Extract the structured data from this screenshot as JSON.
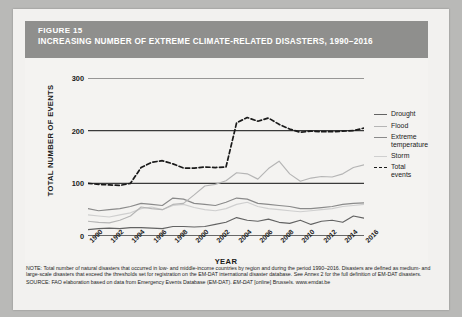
{
  "header": {
    "figure_label": "FIGURE 15",
    "title": "INCREASING NUMBER OF EXTREME CLIMATE-RELATED DISASTERS, 1990–2016"
  },
  "axes": {
    "ylabel": "TOTAL NUMBER OF EVENTS",
    "xlabel": "YEAR"
  },
  "legend": {
    "items": [
      {
        "label": "Drought",
        "color": "#636363",
        "style": "solid"
      },
      {
        "label": "Flood",
        "color": "#b5b5b5",
        "style": "solid"
      },
      {
        "label": "Extreme temperature",
        "color": "#8a8a8a",
        "style": "solid"
      },
      {
        "label": "Storm",
        "color": "#cfcfcf",
        "style": "solid"
      },
      {
        "label": "Total events",
        "color": "#1a1a1a",
        "style": "dashed"
      }
    ]
  },
  "notes": {
    "note": "NOTE: Total number of natural disasters that occurred in low- and middle-income countries by region and during the period 1990–2016. Disasters are defined as medium- and large-scale disasters that exceed the thresholds set for registration on the EM-DAT international disaster database. See Annex 2 for the full definition of EM-DAT disasters.",
    "source_prefix": "SOURCE: FAO elaboration based on data from Emergency Events Database (EM-DAT). ",
    "source_italic": "EM-DAT ",
    "source_suffix": "[online] Brussels. www.emdat.be"
  },
  "chart_data": {
    "type": "line",
    "title": "INCREASING NUMBER OF EXTREME CLIMATE-RELATED DISASTERS, 1990–2016",
    "xlabel": "YEAR",
    "ylabel": "TOTAL NUMBER OF EVENTS",
    "grid": true,
    "legend_position": "right",
    "xlim": [
      1990,
      2016
    ],
    "ylim": [
      0,
      300
    ],
    "yticks": [
      0,
      100,
      200,
      300
    ],
    "xticks": [
      1990,
      1992,
      1994,
      1996,
      1998,
      2000,
      2002,
      2004,
      2006,
      2008,
      2010,
      2012,
      2014,
      2016
    ],
    "x": [
      1990,
      1991,
      1992,
      1993,
      1994,
      1995,
      1996,
      1997,
      1998,
      1999,
      2000,
      2001,
      2002,
      2003,
      2004,
      2005,
      2006,
      2007,
      2008,
      2009,
      2010,
      2011,
      2012,
      2013,
      2014,
      2015,
      2016
    ],
    "series": [
      {
        "name": "Total events",
        "color": "#1a1a1a",
        "style": "dashed",
        "values": [
          100,
          98,
          97,
          96,
          100,
          130,
          140,
          143,
          137,
          129,
          129,
          131,
          130,
          131,
          215,
          225,
          218,
          224,
          212,
          203,
          197,
          199,
          198,
          198,
          199,
          200,
          205
        ]
      },
      {
        "name": "Flood",
        "color": "#b5b5b5",
        "style": "solid",
        "values": [
          28,
          26,
          25,
          30,
          38,
          55,
          52,
          50,
          60,
          62,
          78,
          95,
          98,
          105,
          120,
          118,
          108,
          128,
          142,
          118,
          104,
          110,
          113,
          112,
          118,
          130,
          135
        ]
      },
      {
        "name": "Extreme temperature",
        "color": "#8a8a8a",
        "style": "solid",
        "values": [
          52,
          48,
          50,
          52,
          56,
          62,
          60,
          58,
          72,
          70,
          62,
          60,
          58,
          64,
          72,
          70,
          62,
          60,
          58,
          56,
          52,
          52,
          54,
          56,
          60,
          62,
          63
        ]
      },
      {
        "name": "Storm",
        "color": "#cfcfcf",
        "style": "solid",
        "values": [
          40,
          38,
          36,
          40,
          44,
          52,
          55,
          50,
          58,
          60,
          54,
          50,
          48,
          52,
          60,
          64,
          56,
          52,
          50,
          48,
          46,
          48,
          50,
          52,
          56,
          58,
          60
        ]
      },
      {
        "name": "Drought",
        "color": "#636363",
        "style": "solid",
        "values": [
          12,
          14,
          15,
          14,
          16,
          16,
          15,
          14,
          18,
          18,
          17,
          18,
          22,
          26,
          35,
          30,
          28,
          32,
          26,
          24,
          30,
          22,
          28,
          30,
          26,
          38,
          34
        ]
      }
    ]
  }
}
